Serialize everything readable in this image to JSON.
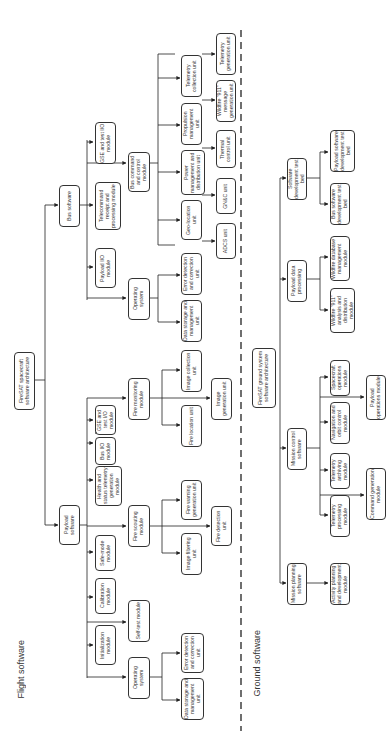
{
  "sections": {
    "flight": "Flight software",
    "ground": "Ground software"
  },
  "flight": {
    "root": "FireSAT spacecraft software architecture",
    "bus": {
      "label": "Bus software",
      "children": {
        "telecommand": "Telecommand receipt and processing module",
        "gse_test_io": "GSE and test I/O module",
        "payload_io": "Payload I/O module",
        "bus_command": "Bus command and control module",
        "operating_system": "Operating system",
        "os_data_storage": "Data storage and management unit",
        "os_error_detection": "Error detection and correction unit",
        "geo_location": "Geo-location unit",
        "adcs": "ADCS unit",
        "gnc": "GN&C unit",
        "power": "Power management and distribution unit",
        "thermal": "Thermal control unit",
        "propulsion": "Propulsion management unit",
        "wildfire_911": "Wildfire \"911\" message generation unit",
        "telemetry_collection": "Telemetry collection unit",
        "telemetry_generation": "Telemetry generation unit"
      }
    },
    "payload": {
      "label": "Payload software",
      "children": {
        "initialization": "Initialization module",
        "calibration": "Calibration module",
        "safe_mode": "Safe-mode module",
        "health_status": "Health and status telemetry generation module",
        "bus_io": "Bus I/O module",
        "gse_test_io": "GSE and test I/O module",
        "operating_system": "Operating system",
        "os_data_storage": "Data storage and management unit",
        "os_error_detection": "Error detection and correction unit",
        "self_test": "Self-test module",
        "fire_scouting": "Fire scouting module",
        "image_filtering": "Image filtering unit",
        "fire_warning": "Fire warning generation unit",
        "fire_detection": "Fire detection unit",
        "fire_monitoring": "Fire monitoring module",
        "fire_location": "Fire location unit",
        "image_collection": "Image collection unit",
        "image_generation": "Image generation unit"
      }
    }
  },
  "ground": {
    "root": "FireSAT ground system software architecture",
    "mission_planning": "Mission planning software",
    "activity_planning": "Activity planning and development module",
    "mission_control": "Mission control software",
    "telemetry_processing": "Telemetry processing module",
    "telemetry_archiving": "Telemetry archiving module",
    "navigation_orbit": "Navigation and orbit control module",
    "spacecraft_ops": "Spacecraft operations module",
    "command_generation": "Command generation module",
    "payload_ops": "Payload operations module",
    "payload_data": "Payload data processing",
    "wildfire_911_analysis": "Wildfire \"911\" analysis and distribution module",
    "wildfire_db": "Wildfire database management module",
    "sw_dev_testbed": "Software development test bed",
    "bus_sw_testbed": "Bus software development test bed",
    "payload_sw_testbed": "Payload software development test bed"
  }
}
